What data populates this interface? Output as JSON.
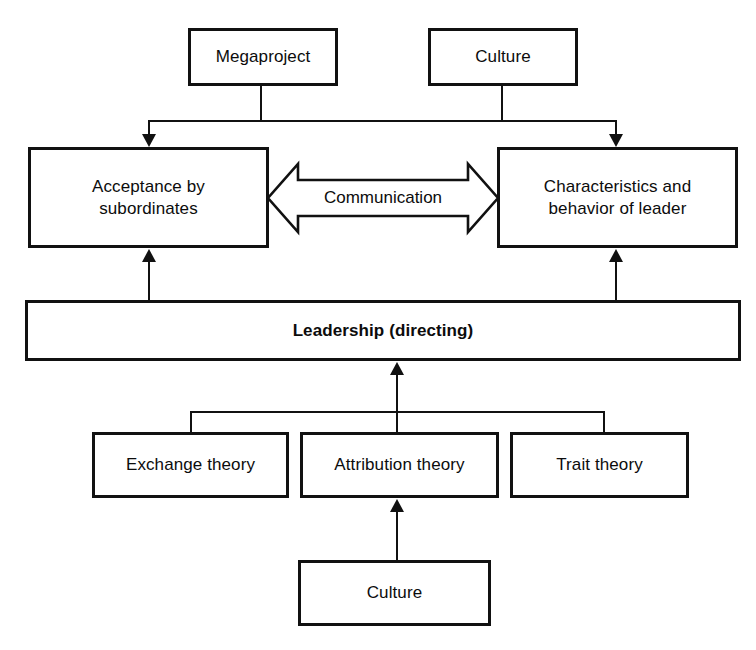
{
  "diagram": {
    "colors": {
      "stroke": "#111111",
      "fill": "#ffffff",
      "text": "#0c0c0c"
    },
    "nodes": {
      "megaproject": {
        "label": "Megaproject"
      },
      "culture_top": {
        "label": "Culture"
      },
      "acceptance": {
        "label": "Acceptance by\nsubordinates"
      },
      "characteristics": {
        "label": "Characteristics and\nbehavior of leader"
      },
      "leadership": {
        "label": "Leadership (directing)"
      },
      "exchange_theory": {
        "label": "Exchange theory"
      },
      "attribution_theory": {
        "label": "Attribution theory"
      },
      "trait_theory": {
        "label": "Trait theory"
      },
      "culture_bottom": {
        "label": "Culture"
      }
    },
    "edges": {
      "communication": {
        "label": "Communication"
      }
    }
  }
}
